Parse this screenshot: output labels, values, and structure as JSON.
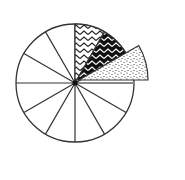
{
  "diagram": {
    "type": "fraction-pie",
    "total_sectors": 12,
    "center": [
      75,
      83
    ],
    "radius": 59,
    "stroke_color": "#333333",
    "background": "#ffffff",
    "shaded_sectors": [
      {
        "index": 0,
        "pattern": "zigzag-on-white",
        "from_deg": 60,
        "to_deg": 90
      },
      {
        "index": 1,
        "pattern": "white-zigzag-on-black",
        "from_deg": 30,
        "to_deg": 60
      },
      {
        "index": 2,
        "pattern": "dots",
        "from_deg": 0,
        "to_deg": 30,
        "exploded": true,
        "radius": 69
      }
    ],
    "unshaded_count": 9
  }
}
